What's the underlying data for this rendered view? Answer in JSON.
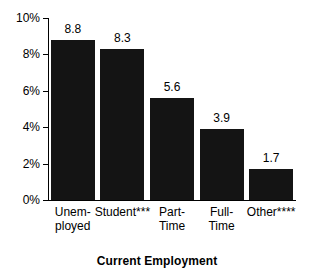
{
  "chart_data": {
    "type": "bar",
    "title": "",
    "xlabel": "Current Employment",
    "ylabel": "",
    "categories": [
      "Unem-\nployed",
      "Student***",
      "Part-\nTime",
      "Full-\nTime",
      "Other****"
    ],
    "category_names": [
      "Unemployed",
      "Student***",
      "Part-Time",
      "Full-Time",
      "Other****"
    ],
    "values": [
      8.8,
      8.3,
      5.6,
      3.9,
      1.7
    ],
    "value_labels": [
      "8.8",
      "8.3",
      "5.6",
      "3.9",
      "1.7"
    ],
    "ylim": [
      0,
      10
    ],
    "ytick_values": [
      0,
      2,
      4,
      6,
      8,
      10
    ],
    "ytick_labels": [
      "0%",
      "2%",
      "4%",
      "6%",
      "8%",
      "10%"
    ],
    "grid": false,
    "legend": false,
    "bar_color": "#141414",
    "axis_color": "#000000",
    "background_color": "#ffffff"
  }
}
